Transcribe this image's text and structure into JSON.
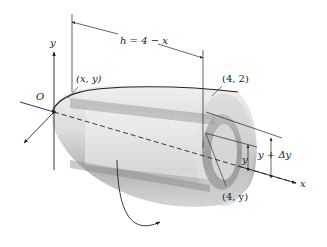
{
  "figure": {
    "type": "solid-of-revolution-shell-diagram",
    "labels": {
      "origin": "O",
      "y_axis": "y",
      "x_axis": "x",
      "point_xy": "(x, y)",
      "point_42": "(4, 2)",
      "point_4y": "(4, y)",
      "height": "h = 4 − x",
      "radius_inner": "y",
      "radius_outer": "y + Δy"
    },
    "colors": {
      "stroke": "#222222",
      "solid_light": "#e2e2e2",
      "solid_mid": "#c4c4c4",
      "solid_dark": "#9a9a9a",
      "shell_band": "#8a8a8a"
    }
  }
}
